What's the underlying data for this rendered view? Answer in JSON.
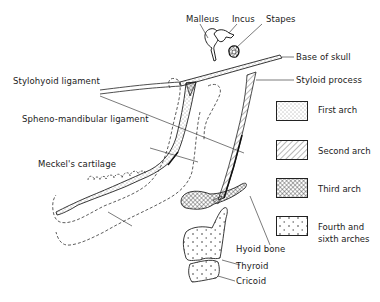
{
  "diagram": {
    "labels": {
      "malleus": "Malleus",
      "incus": "Incus",
      "stapes": "Stapes",
      "base_of_skull": "Base of skull",
      "styloid_process": "Styloid process",
      "stylohyoid_ligament": "Stylohyoid ligament",
      "spheno_mandibular_ligament": "Spheno-mandibular ligament",
      "meckels_cartilage": "Meckel's cartilage",
      "hyoid_bone": "Hyoid bone",
      "thyroid": "Thyroid",
      "cricoid": "Cricoid"
    },
    "legend": [
      {
        "label": "First arch",
        "pattern": "stipple"
      },
      {
        "label": "Second arch",
        "pattern": "diagonal-hatch"
      },
      {
        "label": "Third arch",
        "pattern": "cross-hatch"
      },
      {
        "label_line1": "Fourth and",
        "label_line2": "sixth arches",
        "pattern": "sparse-crosses"
      }
    ]
  }
}
